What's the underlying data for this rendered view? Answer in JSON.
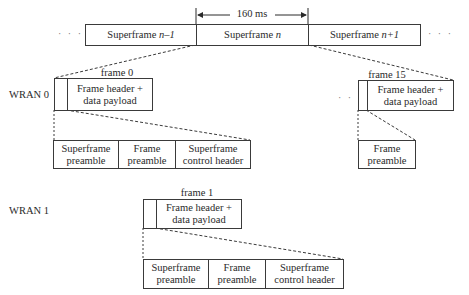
{
  "top_row": {
    "duration_label": "160 ms",
    "ellipsis_left": "· · ·",
    "ellipsis_right": "· · ·",
    "superframes": [
      {
        "label_prefix": "Superframe ",
        "label_var": "n–1"
      },
      {
        "label_prefix": "Superframe ",
        "label_var": "n"
      },
      {
        "label_prefix": "Superframe ",
        "label_var": "n+1"
      }
    ]
  },
  "wran0": {
    "label": "WRAN 0",
    "frame0": {
      "title": "frame 0",
      "content_line1": "Frame header +",
      "content_line2": "data payload"
    },
    "ellipsis": "· · ·",
    "frame15": {
      "title": "frame 15",
      "content_line1": "Frame header +",
      "content_line2": "data payload"
    },
    "expansion_frame0": [
      {
        "line1": "Superframe",
        "line2": "preamble"
      },
      {
        "line1": "Frame",
        "line2": "preamble"
      },
      {
        "line1": "Superframe",
        "line2": "control header"
      }
    ],
    "expansion_frame15": [
      {
        "line1": "Frame",
        "line2": "preamble"
      }
    ]
  },
  "wran1": {
    "label": "WRAN 1",
    "frame1": {
      "title": "frame 1",
      "content_line1": "Frame header +",
      "content_line2": "data payload"
    },
    "expansion_frame1": [
      {
        "line1": "Superframe",
        "line2": "preamble"
      },
      {
        "line1": "Frame",
        "line2": "preamble"
      },
      {
        "line1": "Superframe",
        "line2": "control header"
      }
    ]
  }
}
